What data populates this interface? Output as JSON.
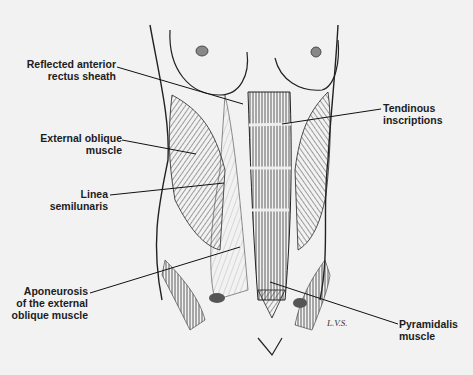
{
  "figure": {
    "signature": "L.V.S.",
    "labels": [
      {
        "id": "reflected-anterior-rectus-sheath",
        "lines": [
          "Reflected anterior",
          "rectus sheath"
        ]
      },
      {
        "id": "external-oblique-muscle",
        "lines": [
          "External oblique",
          "muscle"
        ]
      },
      {
        "id": "linea-semilunaris",
        "lines": [
          "Linea",
          "semilunaris"
        ]
      },
      {
        "id": "aponeurosis-external-oblique",
        "lines": [
          "Aponeurosis",
          "of the external",
          "oblique muscle"
        ]
      },
      {
        "id": "tendinous-inscriptions",
        "lines": [
          "Tendinous",
          "inscriptions"
        ]
      },
      {
        "id": "pyramidalis-muscle",
        "lines": [
          "Pyramidalis",
          "muscle"
        ]
      }
    ]
  }
}
